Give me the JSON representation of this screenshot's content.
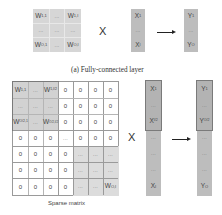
{
  "fc_layer": {
    "caption": "(a) Fully-connected layer",
    "weight_matrix": {
      "rows": [
        [
          "W1,1",
          "...",
          "W1,I"
        ],
        [
          "...",
          "...",
          "..."
        ],
        [
          "WO,1",
          "...",
          "WO,I"
        ]
      ],
      "labels": {
        "w11": {
          "base": "W",
          "sub": "1,1"
        },
        "w1i": {
          "base": "W",
          "sub": "1,I"
        },
        "wo1": {
          "base": "W",
          "sub": "O,1"
        },
        "woi": {
          "base": "W",
          "sub": "O,I"
        },
        "dots": "..."
      }
    },
    "operator": "X",
    "input_vector": {
      "top": {
        "base": "X",
        "sub": "1"
      },
      "middle": "...",
      "bottom": {
        "base": "X",
        "sub": "I"
      }
    },
    "output_vector": {
      "top": {
        "base": "Y",
        "sub": "1"
      },
      "middle": "...",
      "bottom": {
        "base": "Y",
        "sub": "O"
      }
    }
  },
  "sparse": {
    "caption": "Sparse matrix",
    "operator": "X",
    "zero": "0",
    "dots": "...",
    "block_top_left": {
      "w11": {
        "base": "W",
        "sub": "1,1"
      },
      "w1i2": {
        "base": "W",
        "sub": "1,I/2"
      },
      "wo21": {
        "base": "W",
        "sub": "O/2,1"
      },
      "wo2i2": {
        "base": "W",
        "sub": "O/2,I/2"
      }
    },
    "block_bottom_right": {
      "woi": {
        "base": "W",
        "sub": "O,I"
      }
    },
    "grid": {
      "rows": 7,
      "cols": 7,
      "cells": [
        [
          "W1,1",
          "...",
          "W1,I/2",
          "0",
          "0",
          "0",
          "0"
        ],
        [
          "...",
          "...",
          "...",
          "0",
          "0",
          "0",
          "0"
        ],
        [
          "WO/2,1",
          "...",
          "WO/2,I/2",
          "0",
          "0",
          "0",
          "0"
        ],
        [
          "0",
          "0",
          "0",
          "...",
          "0",
          "0",
          "0"
        ],
        [
          "0",
          "0",
          "0",
          "0",
          "...",
          "...",
          "..."
        ],
        [
          "0",
          "0",
          "0",
          "0",
          "...",
          "...",
          "..."
        ],
        [
          "0",
          "0",
          "0",
          "0",
          "...",
          "...",
          "WO,I"
        ]
      ]
    },
    "input_vector": {
      "items": [
        {
          "base": "X",
          "sub": "1"
        },
        {
          "text": "..."
        },
        {
          "base": "X",
          "sub": "I/2"
        },
        {
          "text": "..."
        },
        {
          "text": "..."
        },
        {
          "text": "..."
        },
        {
          "base": "X",
          "sub": "I"
        }
      ]
    },
    "output_vector": {
      "items": [
        {
          "base": "Y",
          "sub": "1"
        },
        {
          "text": "..."
        },
        {
          "base": "Y",
          "sub": "O/2"
        },
        {
          "text": "..."
        },
        {
          "text": "..."
        },
        {
          "text": "..."
        },
        {
          "base": "Y",
          "sub": "O"
        }
      ]
    }
  },
  "colors": {
    "matrix_shade": "#d6d6d6",
    "vector_shade": "#bdbdbd",
    "grid_line": "#9a9a9a",
    "block_border": "#7a7a7a"
  }
}
